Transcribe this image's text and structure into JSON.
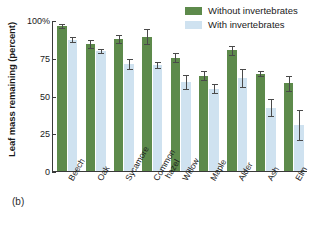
{
  "panel_letter": "(b)",
  "legend": {
    "position": "top-right",
    "items": [
      {
        "label": "Without invertebrates",
        "color": "#5d8a4b",
        "swatch": "dark"
      },
      {
        "label": "With invertebrates",
        "color": "#cfe2f0",
        "swatch": "light"
      }
    ]
  },
  "chart_data": {
    "type": "bar",
    "title": "",
    "xlabel": "",
    "ylabel": "Leaf mass remaining (percent)",
    "ylim": [
      0,
      100
    ],
    "yticks": [
      0,
      25,
      50,
      75,
      100
    ],
    "ytick_labels": [
      "0",
      "25",
      "50",
      "75",
      "100%"
    ],
    "grid": false,
    "legend_position": "top-right",
    "categories": [
      "Beech",
      "Oak",
      "Sycamore",
      "Common hazel",
      "Willow",
      "Maple",
      "Alder",
      "Ash",
      "Elm"
    ],
    "series": [
      {
        "name": "Without invertebrates",
        "color": "#5d8a4b",
        "values": [
          96,
          84,
          87.5,
          89,
          75,
          63,
          80,
          64.5,
          58
        ],
        "errors": [
          1.5,
          2.5,
          2.5,
          5,
          3,
          3,
          3,
          1.5,
          5
        ]
      },
      {
        "name": "With invertebrates",
        "color": "#cfe2f0",
        "values": [
          87,
          79.5,
          71,
          70.5,
          59,
          54.5,
          61.5,
          42,
          30.5
        ],
        "errors": [
          1.5,
          1.5,
          3.5,
          2,
          4.5,
          3,
          6,
          5.5,
          10
        ]
      }
    ]
  }
}
